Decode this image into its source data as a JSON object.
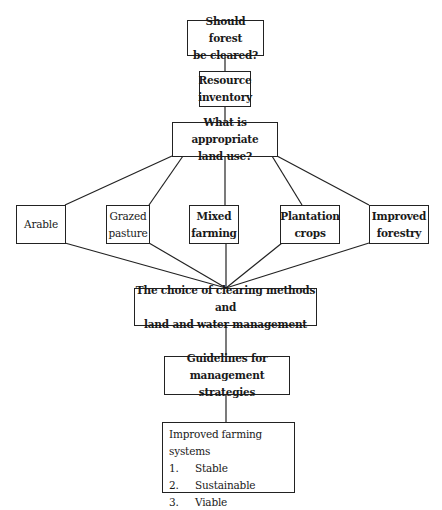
{
  "nodes": {
    "question": {
      "line1": "Should forest",
      "line2": "be cleared?"
    },
    "inventory": {
      "line1": "Resource",
      "line2": "inventory"
    },
    "land_use": {
      "line1": "What is appropriate",
      "line2": "land use?"
    },
    "options": [
      {
        "line1": "",
        "line2": "Arable"
      },
      {
        "line1": "Grazed",
        "line2": "pasture"
      },
      {
        "line1": "Mixed",
        "line2": "farming"
      },
      {
        "line1": "Plantation",
        "line2": "crops"
      },
      {
        "line1": "Improved",
        "line2": "forestry"
      }
    ],
    "clearing": {
      "line1": "The choice of clearing methods and",
      "line2": "land and water management"
    },
    "guidelines": {
      "line1": "Guidelines for",
      "line2": "management strategies"
    },
    "outcome": {
      "title": "Improved farming systems",
      "items": [
        {
          "num": "1.",
          "label": "Stable"
        },
        {
          "num": "2.",
          "label": "Sustainable"
        },
        {
          "num": "3.",
          "label": "Viable"
        }
      ]
    }
  }
}
